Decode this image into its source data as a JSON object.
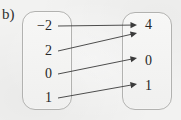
{
  "figure": {
    "part_label": "b)",
    "type": "mapping-diagram",
    "background_color": "#f2f2f1",
    "box_border_color": "#b2b2b0",
    "arrow_color": "#3a3a3a",
    "text_color": "#272727"
  },
  "domain_set": {
    "name": "domain",
    "elements": [
      {
        "label": "−2",
        "x": 52,
        "y": 26
      },
      {
        "label": "2",
        "x": 52,
        "y": 51
      },
      {
        "label": "0",
        "x": 52,
        "y": 74
      },
      {
        "label": "1",
        "x": 52,
        "y": 98
      }
    ]
  },
  "codomain_set": {
    "name": "codomain",
    "elements": [
      {
        "label": "4",
        "x": 145,
        "y": 25
      },
      {
        "label": "0",
        "x": 145,
        "y": 61
      },
      {
        "label": "1",
        "x": 145,
        "y": 86
      }
    ]
  },
  "mappings": [
    {
      "from": "−2",
      "to": "4",
      "x1": 58,
      "y1": 26,
      "x2": 137,
      "y2": 25
    },
    {
      "from": "2",
      "to": "4",
      "x1": 58,
      "y1": 51,
      "x2": 137,
      "y2": 33
    },
    {
      "from": "0",
      "to": "0",
      "x1": 58,
      "y1": 74,
      "x2": 137,
      "y2": 58
    },
    {
      "from": "1",
      "to": "1",
      "x1": 58,
      "y1": 98,
      "x2": 137,
      "y2": 84
    }
  ]
}
